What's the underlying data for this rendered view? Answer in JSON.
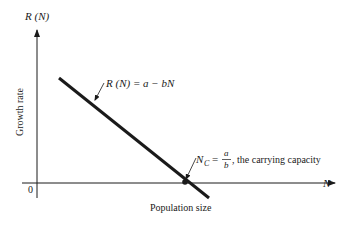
{
  "diagram": {
    "y_axis": {
      "label": "R (N)",
      "title": "Growth rate"
    },
    "x_axis": {
      "label": "N",
      "title": "Population size",
      "origin": "0"
    },
    "line": {
      "equation": "R (N) = a − bN",
      "color": "#1a1a1a"
    },
    "intercept": {
      "symbol": "N",
      "subscript": "C",
      "equals": "=",
      "numerator": "a",
      "denominator": "b",
      "description": ", the carrying capacity"
    }
  }
}
